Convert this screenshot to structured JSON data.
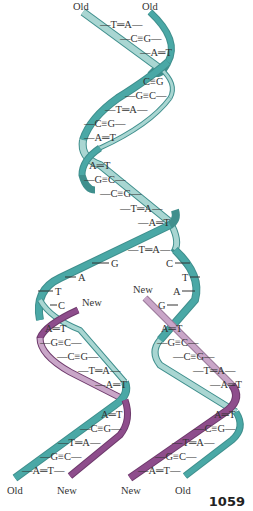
{
  "figure": {
    "type": "dna-replication-fork",
    "colors": {
      "old_strand_dark": "#4aa8a6",
      "old_strand_light": "#a9d6d2",
      "new_strand_dark": "#8e4d8c",
      "new_strand_light": "#c9a6c8",
      "text": "#333333"
    },
    "top_labels": [
      "Old",
      "Old"
    ],
    "parent_helix_pairs": [
      {
        "text": "—T═A—",
        "x": 118,
        "y": 26
      },
      {
        "text": "—C≡G—",
        "x": 143,
        "y": 40
      },
      {
        "text": "—A═T",
        "x": 155,
        "y": 54
      },
      {
        "text": "C≡G",
        "x": 156,
        "y": 83
      },
      {
        "text": "—G≡C—",
        "x": 150,
        "y": 97
      },
      {
        "text": "—T═A—",
        "x": 128,
        "y": 111
      },
      {
        "text": "—C≡G—",
        "x": 104,
        "y": 125
      },
      {
        "text": "—A═T",
        "x": 97,
        "y": 139
      },
      {
        "text": "A═T",
        "x": 99,
        "y": 167
      },
      {
        "text": "—G≡C—",
        "x": 106,
        "y": 181
      },
      {
        "text": "—C≡G—",
        "x": 127,
        "y": 195
      },
      {
        "text": "—T═A—",
        "x": 150,
        "y": 210
      },
      {
        "text": "—A═T",
        "x": 156,
        "y": 224
      },
      {
        "text": "—T═A—",
        "x": 150,
        "y": 250
      }
    ],
    "unpaired_left": [
      {
        "text": "G",
        "x": 115,
        "y": 265
      },
      {
        "text": "A",
        "x": 80,
        "y": 279
      },
      {
        "text": "T",
        "x": 57,
        "y": 293
      },
      {
        "text": "C",
        "x": 60,
        "y": 307
      }
    ],
    "unpaired_right": [
      {
        "text": "C",
        "x": 168,
        "y": 265
      },
      {
        "text": "T",
        "x": 184,
        "y": 279
      },
      {
        "text": "A",
        "x": 176,
        "y": 293
      },
      {
        "text": "G",
        "x": 161,
        "y": 307
      }
    ],
    "new_labels": [
      {
        "text": "New",
        "x": 82,
        "y": 306
      },
      {
        "text": "New",
        "x": 134,
        "y": 292
      }
    ],
    "left_daughter_pairs": [
      {
        "text": "A═T",
        "x": 54,
        "y": 330
      },
      {
        "text": "—G≡C—",
        "x": 62,
        "y": 344
      },
      {
        "text": "—C≡G—",
        "x": 85,
        "y": 358
      },
      {
        "text": "—T═A—",
        "x": 107,
        "y": 372
      },
      {
        "text": "—A═T",
        "x": 115,
        "y": 386
      },
      {
        "text": "A═T",
        "x": 112,
        "y": 416
      },
      {
        "text": "—C≡G—",
        "x": 103,
        "y": 430
      },
      {
        "text": "—T═A—",
        "x": 80,
        "y": 444
      },
      {
        "text": "—G≡C—",
        "x": 59,
        "y": 458
      },
      {
        "text": "—A═T—",
        "x": 43,
        "y": 472
      }
    ],
    "right_daughter_pairs": [
      {
        "text": "A═T",
        "x": 173,
        "y": 330
      },
      {
        "text": "—G≡C—",
        "x": 178,
        "y": 344
      },
      {
        "text": "—C≡G—",
        "x": 200,
        "y": 358
      },
      {
        "text": "—T═A—",
        "x": 218,
        "y": 372
      },
      {
        "text": "—A═T",
        "x": 227,
        "y": 386
      },
      {
        "text": "A═T",
        "x": 225,
        "y": 416
      },
      {
        "text": "—C≡G—",
        "x": 216,
        "y": 430
      },
      {
        "text": "—T═A—",
        "x": 193,
        "y": 444
      },
      {
        "text": "—G≡C—",
        "x": 172,
        "y": 458
      },
      {
        "text": "—A═T—",
        "x": 156,
        "y": 472
      }
    ],
    "bottom_labels": [
      "Old",
      "New",
      "New",
      "Old"
    ],
    "page_number": "1059"
  }
}
